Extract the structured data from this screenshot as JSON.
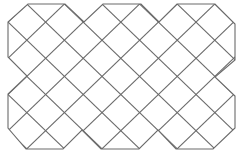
{
  "figure": {
    "stroke_color": "#6b6b6b",
    "stroke_width": 1.1,
    "background": "#ffffff",
    "lattice": {
      "x0": 8,
      "dx": 18.8,
      "nx": 12,
      "y0": 4,
      "dy": 18.1,
      "ny": 8
    },
    "outline": [
      [
        28,
        4
      ],
      [
        65,
        4
      ],
      [
        84,
        22
      ],
      [
        103,
        4
      ],
      [
        141,
        4
      ],
      [
        159,
        22
      ],
      [
        177,
        4
      ],
      [
        215,
        4
      ],
      [
        235,
        24
      ],
      [
        235,
        60
      ],
      [
        215,
        77
      ],
      [
        235,
        96
      ],
      [
        235,
        128
      ],
      [
        213,
        149
      ],
      [
        176,
        149
      ],
      [
        158,
        130
      ],
      [
        139,
        149
      ],
      [
        101,
        149
      ],
      [
        82,
        130
      ],
      [
        63,
        149
      ],
      [
        26,
        149
      ],
      [
        8,
        128
      ],
      [
        8,
        94
      ],
      [
        27,
        76
      ],
      [
        8,
        57
      ],
      [
        8,
        22
      ]
    ]
  }
}
